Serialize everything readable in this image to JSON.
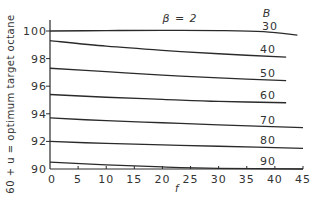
{
  "chart_data": {
    "type": "line",
    "title": "",
    "xlabel": "f",
    "ylabel": "60 + u = optimum target octane",
    "xlim": [
      0,
      45
    ],
    "ylim": [
      90,
      100.5
    ],
    "x_ticks": [
      0,
      5,
      10,
      15,
      20,
      25,
      30,
      35,
      40,
      45
    ],
    "y_ticks": [
      90,
      92,
      94,
      96,
      98,
      100
    ],
    "grid": false,
    "legend_title": "B",
    "annotation": "β = 2",
    "series": [
      {
        "name": "30",
        "x": [
          0,
          10,
          20,
          30,
          38,
          44
        ],
        "values": [
          100.0,
          100.03,
          100.05,
          100.03,
          99.95,
          99.7
        ]
      },
      {
        "name": "40",
        "x": [
          0,
          10,
          20,
          30,
          42
        ],
        "values": [
          99.3,
          98.9,
          98.6,
          98.35,
          98.1
        ]
      },
      {
        "name": "50",
        "x": [
          0,
          10,
          20,
          30,
          42
        ],
        "values": [
          97.3,
          97.05,
          96.8,
          96.6,
          96.4
        ]
      },
      {
        "name": "60",
        "x": [
          0,
          10,
          20,
          30,
          42
        ],
        "values": [
          95.4,
          95.2,
          95.05,
          94.9,
          94.8
        ]
      },
      {
        "name": "70",
        "x": [
          0,
          10,
          20,
          30,
          45
        ],
        "values": [
          93.7,
          93.5,
          93.35,
          93.2,
          93.0
        ]
      },
      {
        "name": "80",
        "x": [
          0,
          10,
          20,
          30,
          45
        ],
        "values": [
          92.0,
          91.85,
          91.75,
          91.65,
          91.5
        ]
      },
      {
        "name": "90",
        "x": [
          0,
          10,
          20,
          30,
          45
        ],
        "values": [
          90.5,
          90.3,
          90.15,
          90.05,
          90.0
        ]
      }
    ]
  },
  "labels": {
    "y_axis": "60 + u = optimum target octane",
    "x_axis": "f",
    "annotation": "β = 2",
    "legend_title": "B"
  }
}
